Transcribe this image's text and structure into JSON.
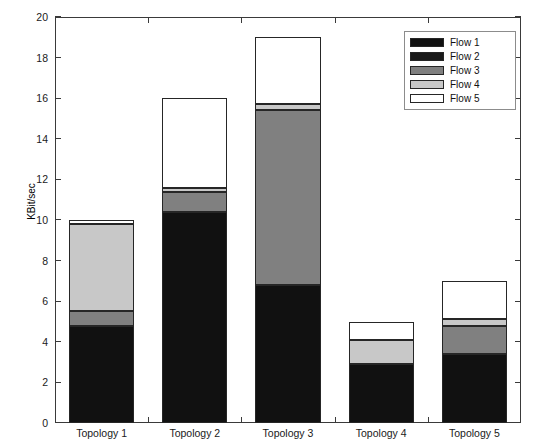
{
  "chart_data": {
    "type": "bar",
    "subtype": "stacked-bar",
    "title": "",
    "xlabel": "",
    "ylabel": "KBit/sec",
    "ylim": [
      0,
      20
    ],
    "yticks": [
      0,
      2,
      4,
      6,
      8,
      10,
      12,
      14,
      16,
      18,
      20
    ],
    "ytick_labels": [
      "0",
      "2",
      "4",
      "6",
      "8",
      "10",
      "12",
      "14",
      "16",
      "18",
      "20"
    ],
    "grid": false,
    "legend_position": "top-right",
    "categories": [
      "Topology 1",
      "Topology 2",
      "Topology 3",
      "Topology 4",
      "Topology 5"
    ],
    "series": [
      {
        "name": "Flow 1",
        "color": "#111111",
        "values": [
          4.8,
          10.4,
          6.8,
          2.9,
          3.4
        ]
      },
      {
        "name": "Flow 2",
        "color": "#1a1a1a",
        "values": [
          0.0,
          0.0,
          0.0,
          0.0,
          0.0
        ]
      },
      {
        "name": "Flow 3",
        "color": "#808080",
        "values": [
          0.7,
          1.0,
          8.6,
          0.0,
          1.4
        ]
      },
      {
        "name": "Flow 4",
        "color": "#c8c8c8",
        "values": [
          4.3,
          0.2,
          0.3,
          1.2,
          0.3
        ]
      },
      {
        "name": "Flow 5",
        "color": "#ffffff",
        "values": [
          0.2,
          4.4,
          3.3,
          0.9,
          1.9
        ]
      }
    ],
    "totals": [
      10.0,
      16.0,
      19.0,
      5.0,
      7.0
    ]
  },
  "legend": {
    "entries": [
      {
        "label": "Flow 1",
        "color": "#111111"
      },
      {
        "label": "Flow 2",
        "color": "#1a1a1a"
      },
      {
        "label": "Flow 3",
        "color": "#808080"
      },
      {
        "label": "Flow 4",
        "color": "#c8c8c8"
      },
      {
        "label": "Flow 5",
        "color": "#ffffff"
      }
    ]
  }
}
